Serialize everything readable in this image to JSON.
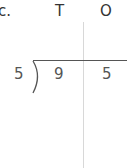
{
  "problem_label": "c.",
  "columns": {
    "tens_header": "T",
    "ones_header": "O"
  },
  "division": {
    "divisor": "5",
    "dividend_tens": "9",
    "dividend_ones": "5"
  },
  "colors": {
    "text": "#333333",
    "divider_line": "#d8d8d8",
    "bracket_line": "#555555"
  }
}
